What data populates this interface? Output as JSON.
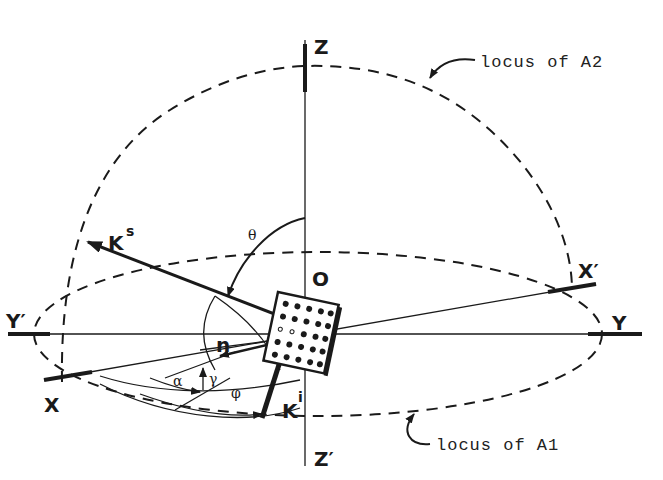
{
  "diagram": {
    "axes": {
      "z_pos": "Z",
      "z_neg": "Z′",
      "x_pos": "X",
      "x_neg": "X′",
      "y_pos": "Y",
      "y_neg": "Y′",
      "origin": "O"
    },
    "vectors": {
      "scattered": {
        "base": "K",
        "sup": "s"
      },
      "incident": {
        "base": "K",
        "sup": "i"
      },
      "normal": "n"
    },
    "angles": {
      "theta": "θ",
      "phi": "φ",
      "alpha": "α",
      "gamma": "γ"
    },
    "annotations": {
      "upper": "locus of A2",
      "lower": "locus of A1"
    },
    "colors": {
      "ink": "#1a1a1a",
      "background": "#ffffff"
    }
  }
}
